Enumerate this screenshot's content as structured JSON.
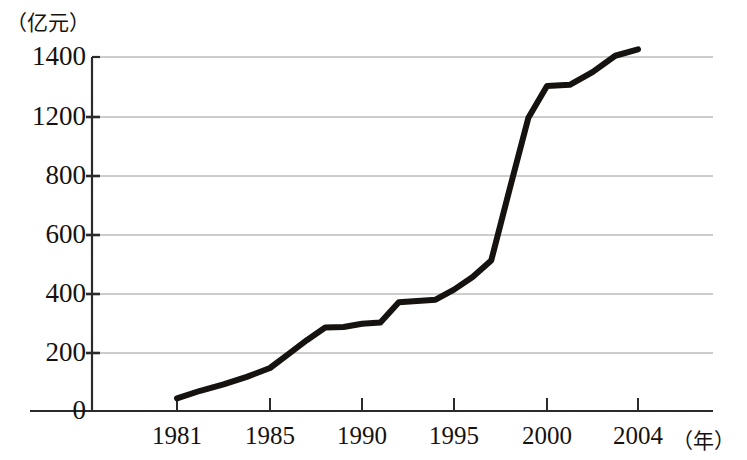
{
  "chart_data": {
    "type": "line",
    "title": "",
    "subtitle": "",
    "ylabel": "（亿元）",
    "xlabel": "（年）",
    "x": [
      1981,
      1982,
      1983,
      1984,
      1985,
      1986,
      1987,
      1988,
      1989,
      1990,
      1991,
      1992,
      1993,
      1994,
      1995,
      1996,
      1997,
      1998,
      1999,
      2000,
      2001,
      2002,
      2003,
      2004
    ],
    "values": [
      50,
      80,
      105,
      135,
      170,
      225,
      280,
      330,
      332,
      345,
      350,
      430,
      435,
      440,
      480,
      530,
      595,
      880,
      1160,
      1285,
      1290,
      1340,
      1405,
      1430
    ],
    "series": [
      {
        "name": "",
        "values": [
          50,
          80,
          105,
          135,
          170,
          225,
          280,
          330,
          332,
          345,
          350,
          430,
          435,
          440,
          480,
          530,
          595,
          880,
          1160,
          1285,
          1290,
          1340,
          1405,
          1430
        ]
      }
    ],
    "x_tick_labels": [
      "1981",
      "1985",
      "1990",
      "1995",
      "2000",
      "2004"
    ],
    "x_tick_values": [
      1981,
      1985,
      1990,
      1995,
      2000,
      2004
    ],
    "y_tick_labels": [
      "0",
      "200",
      "400",
      "600",
      "800",
      "1200",
      "1400"
    ],
    "y_tick_values": [
      0,
      200,
      400,
      600,
      800,
      1000,
      1200
    ],
    "ylim": [
      0,
      1400
    ],
    "xlim": [
      1980,
      2005
    ],
    "grid": true,
    "legend": "none",
    "line_color": "#15120f",
    "grid_color": "#8a8a8a",
    "axis_color": "#2b2b2b",
    "background": "#ffffff",
    "note": "Y tick labels as printed in the source read 0, 200, 400, 600, 800, 1200, 1400 over seven evenly spaced gridlines; the 1000 label is absent in the original."
  },
  "axis": {
    "y_unit_text": "（亿元）",
    "x_unit_text": "（年）"
  },
  "y_labels": [
    {
      "text": "1400",
      "y": 57
    },
    {
      "text": "1200",
      "y": 117
    },
    {
      "text": "800",
      "y": 176
    },
    {
      "text": "600",
      "y": 235
    },
    {
      "text": "400",
      "y": 294
    },
    {
      "text": "200",
      "y": 353
    },
    {
      "text": "0",
      "y": 411
    }
  ],
  "x_labels": [
    {
      "text": "1981",
      "x": 177
    },
    {
      "text": "1985",
      "x": 270
    },
    {
      "text": "1990",
      "x": 362
    },
    {
      "text": "1995",
      "x": 454
    },
    {
      "text": "2000",
      "x": 547
    },
    {
      "text": "2004",
      "x": 638
    }
  ]
}
